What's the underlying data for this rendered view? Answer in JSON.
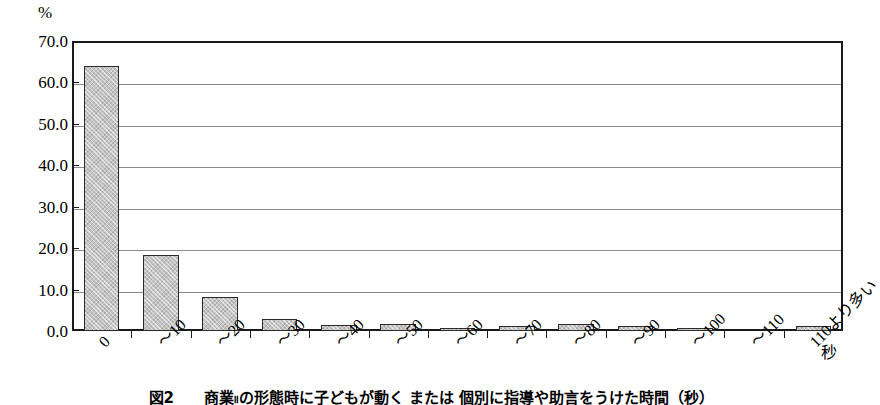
{
  "chart_data": {
    "type": "bar",
    "title": "",
    "xlabel": "秒",
    "ylabel": "%",
    "ylim": [
      0.0,
      70.0
    ],
    "ytick_step": 10.0,
    "ytick_labels": [
      "0.0",
      "10.0",
      "20.0",
      "30.0",
      "40.0",
      "50.0",
      "60.0",
      "70.0"
    ],
    "ytick_values": [
      0.0,
      10.0,
      20.0,
      30.0,
      40.0,
      50.0,
      60.0,
      70.0
    ],
    "grid": true,
    "legend": "none",
    "categories": [
      "0",
      "～10",
      "～20",
      "～30",
      "～40",
      "～50",
      "～60",
      "～70",
      "～80",
      "～90",
      "～100",
      "～110",
      "110より多い"
    ],
    "values": [
      64.0,
      18.4,
      8.2,
      2.8,
      1.4,
      1.7,
      0.8,
      1.3,
      1.7,
      1.1,
      0.6,
      0.0,
      1.3
    ]
  },
  "axis": {
    "y_unit_label": "%",
    "x_unit_label": "秒"
  },
  "caption": {
    "text": "図2　　商業။の形態時に子どもが動く または 個別に指導や助言をうけた時間（秒）"
  },
  "colors": {
    "bar_fill": "#c4c4c4",
    "bar_border": "#2b2b2b",
    "axis": "#1a1a1a",
    "grid": "#8a8a8a",
    "background": "#ffffff"
  }
}
